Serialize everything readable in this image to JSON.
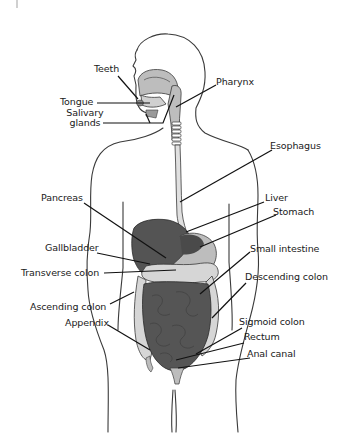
{
  "diagram": {
    "colors": {
      "outline": "#3a3a3a",
      "organ_dark": "#545454",
      "organ_mid": "#6e6e6e",
      "organ_light": "#bdbdbd",
      "colon_light": "#d6d6d6",
      "leader": "#111111"
    },
    "labels": [
      {
        "id": "teeth",
        "text": "Teeth"
      },
      {
        "id": "tongue",
        "text": "Tongue"
      },
      {
        "id": "salivary_1",
        "text": "Salivary"
      },
      {
        "id": "salivary_2",
        "text": "glands"
      },
      {
        "id": "pharynx",
        "text": "Pharynx"
      },
      {
        "id": "esophagus",
        "text": "Esophagus"
      },
      {
        "id": "pancreas",
        "text": "Pancreas"
      },
      {
        "id": "liver",
        "text": "Liver"
      },
      {
        "id": "stomach",
        "text": "Stomach"
      },
      {
        "id": "gallbladder",
        "text": "Gallbladder"
      },
      {
        "id": "small_intestine",
        "text": "Small intestine"
      },
      {
        "id": "transverse_colon",
        "text": "Transverse colon"
      },
      {
        "id": "descending_colon",
        "text": "Descending colon"
      },
      {
        "id": "ascending_colon",
        "text": "Ascending colon"
      },
      {
        "id": "appendix",
        "text": "Appendix"
      },
      {
        "id": "sigmoid_colon",
        "text": "Sigmoid colon"
      },
      {
        "id": "rectum",
        "text": "Rectum"
      },
      {
        "id": "anal_canal",
        "text": "Anal canal"
      }
    ]
  }
}
